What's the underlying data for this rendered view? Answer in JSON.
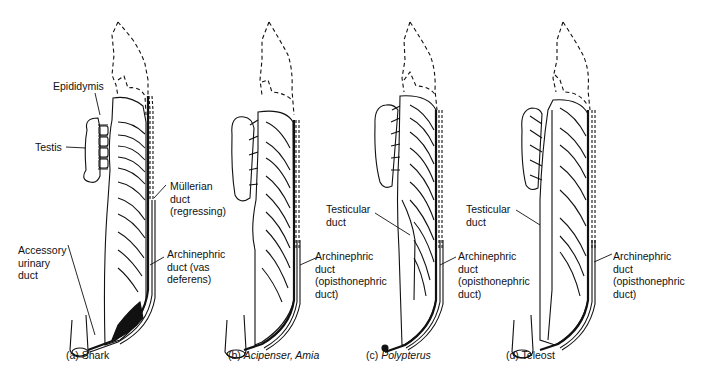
{
  "figure": {
    "panels": [
      {
        "id": "a",
        "caption_prefix": "(a)",
        "caption_name": "Shark",
        "labels": {
          "epididymis": "Epididymis",
          "testis": "Testis",
          "mullerian": "Müllerian\nduct\n(regressing)",
          "accessory": "Accessory\nurinary\nduct",
          "archinephric": "Archinephric\nduct (vas\ndeferens)"
        }
      },
      {
        "id": "b",
        "caption_prefix": "(b)",
        "caption_name": "Acipenser, Amia",
        "labels": {
          "archinephric": "Archinephric\nduct\n(opisthonephric\nduct)"
        }
      },
      {
        "id": "c",
        "caption_prefix": "(c)",
        "caption_name": "Polypterus",
        "labels": {
          "testicular": "Testicular\nduct",
          "archinephric": "Archinephric\nduct\n(opisthonephric\nduct)"
        }
      },
      {
        "id": "d",
        "caption_prefix": "(d)",
        "caption_name": "Teleost",
        "labels": {
          "testicular": "Testicular\nduct",
          "archinephric": "Archinephric\nduct\n(opisthonephric\nduct)"
        }
      }
    ]
  }
}
